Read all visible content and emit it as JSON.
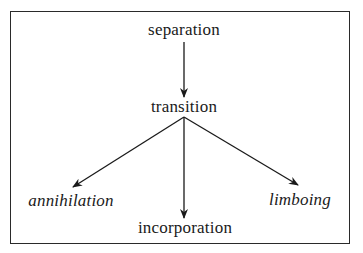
{
  "diagram": {
    "type": "flow",
    "nodes": [
      {
        "id": "separation",
        "label": "separation",
        "italic": false
      },
      {
        "id": "transition",
        "label": "transition",
        "italic": false
      },
      {
        "id": "annihilation",
        "label": "annihilation",
        "italic": true
      },
      {
        "id": "incorporation",
        "label": "incorporation",
        "italic": false
      },
      {
        "id": "limboing",
        "label": "limboing",
        "italic": true
      }
    ],
    "edges": [
      {
        "from": "separation",
        "to": "transition"
      },
      {
        "from": "transition",
        "to": "annihilation"
      },
      {
        "from": "transition",
        "to": "incorporation"
      },
      {
        "from": "transition",
        "to": "limboing"
      }
    ],
    "colors": {
      "stroke": "#1a1a1a",
      "background": "#ffffff",
      "frame": "#2a2a2a"
    }
  }
}
